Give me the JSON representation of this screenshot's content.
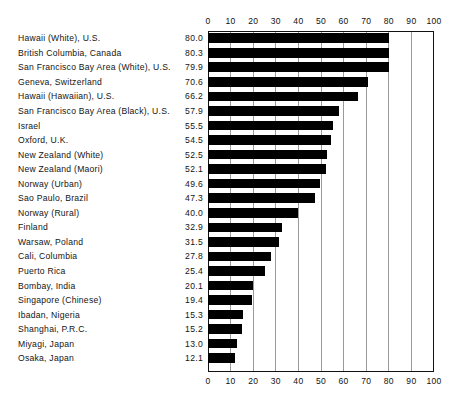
{
  "chart_data": {
    "type": "bar",
    "orientation": "horizontal",
    "title": "",
    "subtitle": "",
    "xlabel": "",
    "ylabel": "",
    "xlim": [
      0,
      100
    ],
    "grid": true,
    "legend": null,
    "axis_ticks": [
      0,
      10,
      20,
      30,
      40,
      50,
      60,
      70,
      80,
      90,
      100
    ],
    "axis_tick_labels": [
      "0",
      "10",
      "20",
      "30",
      "40",
      "50",
      "60",
      "70",
      "80",
      "90",
      "100"
    ],
    "axis_positions": [
      "top",
      "bottom"
    ],
    "bar_color": "#000000",
    "grid_color": "#9a9a9a",
    "frame_color": "#111111",
    "categories": [
      "Hawaii  (White), U.S.",
      "British Columbia, Canada",
      "San Francisco Bay Area  (White), U.S.",
      "Geneva, Switzerland",
      "Hawaii  (Hawaiian), U.S.",
      "San Francisco Bay Area  (Black), U.S.",
      "Israel",
      "Oxford, U.K.",
      "New Zealand  (White)",
      "New Zealand  (Maori)",
      "Norway  (Urban)",
      "Sao Paulo, Brazil",
      "Norway  (Rural)",
      "Finland",
      "Warsaw, Poland",
      "Cali, Columbia",
      "Puerto Rica",
      "Bombay, India",
      "Singapore  (Chinese)",
      "Ibadan, Nigeria",
      "Shanghai, P.R.C.",
      "Miyagi, Japan",
      "Osaka, Japan"
    ],
    "values": [
      80.0,
      80.3,
      79.9,
      70.6,
      66.2,
      57.9,
      55.5,
      54.5,
      52.5,
      52.1,
      49.6,
      47.3,
      40.0,
      32.9,
      31.5,
      27.8,
      25.4,
      20.1,
      19.4,
      15.3,
      15.2,
      13.0,
      12.1
    ],
    "value_labels": [
      "80.0",
      "80.3",
      "79.9",
      "70.6",
      "66.2",
      "57.9",
      "55.5",
      "54.5",
      "52.5",
      "52.1",
      "49.6",
      "47.3",
      "40.0",
      "32.9",
      "31.5",
      "27.8",
      "25.4",
      "20.1",
      "19.4",
      "15.3",
      "15.2",
      "13.0",
      "12.1"
    ]
  }
}
